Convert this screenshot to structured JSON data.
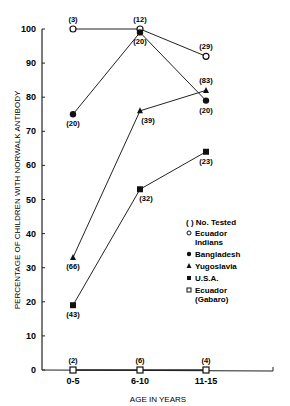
{
  "chart_data": {
    "type": "line",
    "title": "",
    "xlabel": "AGE IN YEARS",
    "ylabel": "PERCENTAGE OF CHILDREN WITH NORWALK ANTIBODY",
    "categories": [
      "0-5",
      "6-10",
      "11-15"
    ],
    "ylim": [
      0,
      100
    ],
    "yticks": [
      0,
      10,
      20,
      30,
      40,
      50,
      60,
      70,
      80,
      90,
      100
    ],
    "grid": false,
    "legend_position": "right-middle",
    "legend_note": "( ) No. Tested",
    "series": [
      {
        "name": "Ecuador Indians",
        "marker": "open-circle",
        "values": [
          100,
          100,
          92
        ],
        "n_tested": [
          "(3)",
          "(12)",
          "(29)"
        ]
      },
      {
        "name": "Bangladesh",
        "marker": "filled-circle",
        "values": [
          75,
          99,
          79
        ],
        "n_tested": [
          "(20)",
          "(20)",
          "(20)"
        ]
      },
      {
        "name": "Yugoslavia",
        "marker": "filled-triangle",
        "values": [
          33,
          76,
          82
        ],
        "n_tested": [
          "(66)",
          "(39)",
          "(83)"
        ]
      },
      {
        "name": "U.S.A.",
        "marker": "filled-square",
        "values": [
          19,
          53,
          64
        ],
        "n_tested": [
          "(43)",
          "(32)",
          "(23)"
        ]
      },
      {
        "name": "Ecuador (Gabaro)",
        "marker": "open-square",
        "values": [
          0,
          0,
          0
        ],
        "n_tested": [
          "(2)",
          "(6)",
          "(4)"
        ]
      }
    ]
  },
  "legend": {
    "note": "( ) No. Tested",
    "items": [
      "Ecuador",
      "Indians",
      "Bangladesh",
      "Yugoslavia",
      "U.S.A.",
      "Ecuador",
      "(Gabaro)"
    ]
  }
}
